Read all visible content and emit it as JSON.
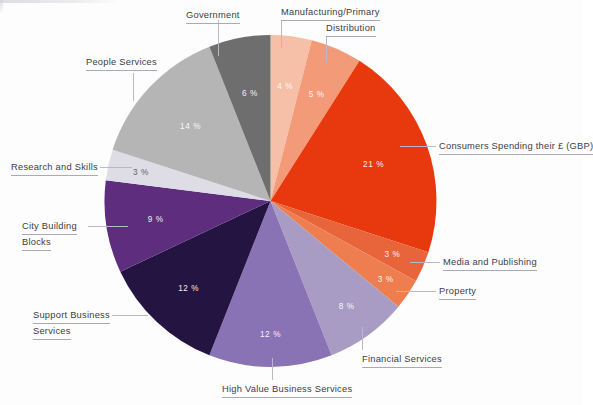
{
  "chart_data": {
    "type": "pie",
    "title": "",
    "subtitle": "",
    "xlabel": "",
    "ylabel": "",
    "legend_position": "callout-labels",
    "grid": false,
    "units": "%",
    "total": 100,
    "start_angle_deg": 0,
    "direction": "clockwise",
    "categories": [
      "Manufacturing/Primary",
      "Distribution",
      "Consumers Spending their £ (GBP)",
      "Media and Publishing",
      "Property",
      "Financial Services",
      "High Value Business Services",
      "Support Business Services",
      "City Building Blocks",
      "Research and Skills",
      "People Services",
      "Government"
    ],
    "values": [
      4,
      5,
      21,
      3,
      3,
      8,
      12,
      12,
      9,
      3,
      14,
      6
    ],
    "value_labels": [
      "4 %",
      "5 %",
      "21 %",
      "3 %",
      "3 %",
      "8 %",
      "12 %",
      "12 %",
      "9 %",
      "3 %",
      "14 %",
      "6 %"
    ],
    "colors": [
      "#F6BFA8",
      "#F39B78",
      "#E8380D",
      "#E8643A",
      "#EE7D4F",
      "#A99CC4",
      "#8A73B4",
      "#241442",
      "#5E2D7E",
      "#DEDCE5",
      "#B5B5B5",
      "#6E6E6E"
    ],
    "slices": [
      {
        "label": "Manufacturing/Primary",
        "value": 4,
        "value_label": "4 %",
        "color": "#F6BFA8",
        "pct_text_color": "#ffffff"
      },
      {
        "label": "Distribution",
        "value": 5,
        "value_label": "5 %",
        "color": "#F39B78",
        "pct_text_color": "#ffffff"
      },
      {
        "label": "Consumers Spending their £ (GBP)",
        "value": 21,
        "value_label": "21 %",
        "color": "#E8380D",
        "pct_text_color": "#ffffff"
      },
      {
        "label": "Media and Publishing",
        "value": 3,
        "value_label": "3 %",
        "color": "#E8643A",
        "pct_text_color": "#ffffff"
      },
      {
        "label": "Property",
        "value": 3,
        "value_label": "3 %",
        "color": "#EE7D4F",
        "pct_text_color": "#ffffff"
      },
      {
        "label": "Financial Services",
        "value": 8,
        "value_label": "8 %",
        "color": "#A99CC4",
        "pct_text_color": "#ffffff"
      },
      {
        "label": "High Value Business Services",
        "value": 12,
        "value_label": "12 %",
        "color": "#8A73B4",
        "pct_text_color": "#ffffff"
      },
      {
        "label": "Support Business Services",
        "value": 12,
        "value_label": "12 %",
        "color": "#241442",
        "pct_text_color": "#ffffff"
      },
      {
        "label": "City Building Blocks",
        "value": 9,
        "value_label": "9 %",
        "color": "#5E2D7E",
        "pct_text_color": "#ffffff"
      },
      {
        "label": "Research and Skills",
        "value": 3,
        "value_label": "3 %",
        "color": "#DEDCE5",
        "pct_text_color": "#5b5b66"
      },
      {
        "label": "People Services",
        "value": 14,
        "value_label": "14 %",
        "color": "#B5B5B5",
        "pct_text_color": "#ffffff"
      },
      {
        "label": "Government",
        "value": 6,
        "value_label": "6 %",
        "color": "#6E6E6E",
        "pct_text_color": "#ffffff"
      }
    ]
  },
  "callouts": {
    "government": {
      "lines": [
        "Government"
      ]
    },
    "manufacturing": {
      "lines": [
        "Manufacturing/Primary"
      ]
    },
    "distribution": {
      "lines": [
        "Distribution"
      ]
    },
    "consumers": {
      "lines": [
        "Consumers Spending their £ (GBP)"
      ]
    },
    "media_publishing": {
      "lines": [
        "Media and Publishing"
      ]
    },
    "property": {
      "lines": [
        "Property"
      ]
    },
    "financial": {
      "lines": [
        "Financial Services"
      ]
    },
    "high_value": {
      "lines": [
        "High Value Business Services"
      ]
    },
    "support_business": {
      "lines": [
        "Support Business",
        "Services"
      ]
    },
    "city_building": {
      "lines": [
        "City Building",
        "Blocks"
      ]
    },
    "research_skills": {
      "lines": [
        "Research and Skills"
      ]
    },
    "people_services": {
      "lines": [
        "People Services"
      ]
    }
  },
  "theme": {
    "background": "#fdfdfd",
    "label_color": "#3c3c46",
    "leader_color": "#b9b9c6",
    "underline_color": "#a9a9bb"
  }
}
